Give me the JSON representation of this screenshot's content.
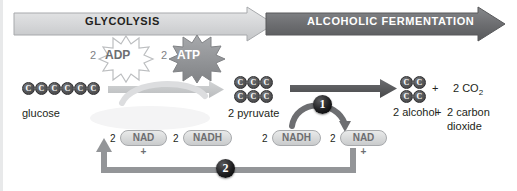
{
  "banner": {
    "glycolysis": "GLYCOLYSIS",
    "fermentation": "ALCOHOLIC FERMENTATION",
    "glycolysis_color": "#d8d9da",
    "fermentation_color": "#6d6e71"
  },
  "energy": {
    "adp": {
      "multiplier": "2",
      "label": "ADP",
      "style": "outline-starburst"
    },
    "atp": {
      "multiplier": "2",
      "label": "ATP",
      "style": "filled-starburst"
    }
  },
  "molecules": {
    "glucose": {
      "caption": "glucose",
      "carbon_label": "C",
      "carbon_count": 6,
      "rows": 1
    },
    "pyruvate": {
      "caption": "2 pyruvate",
      "carbon_label": "C",
      "carbon_count": 6,
      "rows": 2,
      "per_row": 3
    },
    "alcohol": {
      "caption": "2 alcohol",
      "carbon_label": "C",
      "carbon_count": 4,
      "rows": 2,
      "per_row": 2
    }
  },
  "products": {
    "plus_top": "+",
    "co2_prefix": "2 CO",
    "co2_sub": "2",
    "plus_bottom": "+",
    "carbon_line1": "2 carbon",
    "carbon_line2": "dioxide"
  },
  "cofactors": [
    {
      "multiplier": "2",
      "label": "NAD",
      "charge": "+",
      "position": "glycolysis-left"
    },
    {
      "multiplier": "2",
      "label": "NADH",
      "charge": "",
      "position": "glycolysis-right"
    },
    {
      "multiplier": "2",
      "label": "NADH",
      "charge": "",
      "position": "fermentation-left"
    },
    {
      "multiplier": "2",
      "label": "NAD",
      "charge": "+",
      "position": "fermentation-right"
    }
  ],
  "steps": [
    {
      "number": "1",
      "position": "fermentation-transfer"
    },
    {
      "number": "2",
      "position": "nad-recycle-return"
    }
  ],
  "colors": {
    "molecule_fill": "#58595b",
    "pill_fill": "#d5d7d8",
    "arrow_light": "#c7c9ca",
    "arrow_dark": "#58595b",
    "step_circle": "#000000",
    "text": "#231f20"
  }
}
